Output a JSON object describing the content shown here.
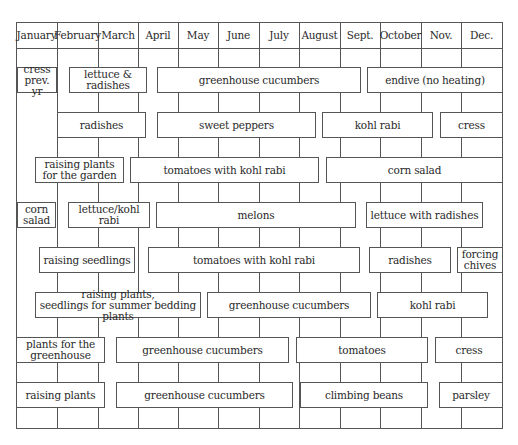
{
  "chart_data": {
    "type": "table",
    "months": [
      "January",
      "February",
      "March",
      "April",
      "May",
      "June",
      "July",
      "August",
      "Sept.",
      "October",
      "Nov.",
      "Dec."
    ],
    "rows": [
      [
        {
          "label": "cress prev. yr",
          "lines": [
            "cress",
            "prev. yr"
          ],
          "start": "January",
          "end": "January"
        },
        {
          "label": "lettuce & radishes",
          "start": "February",
          "end": "March"
        },
        {
          "label": "greenhouse cucumbers",
          "start": "April",
          "end": "August"
        },
        {
          "label": "endive (no heating)",
          "start": "Sept.",
          "end": "Dec."
        }
      ],
      [
        {
          "label": "radishes",
          "start": "February",
          "end": "March"
        },
        {
          "label": "sweet peppers",
          "start": "April",
          "end": "July"
        },
        {
          "label": "kohl rabi",
          "start": "August",
          "end": "October"
        },
        {
          "label": "cress",
          "start": "Nov.",
          "end": "Dec."
        }
      ],
      [
        {
          "label": "raising plants for the garden",
          "lines": [
            "raising plants",
            "for the garden"
          ],
          "start": "January",
          "end": "March"
        },
        {
          "label": "tomatoes with kohl rabi",
          "start": "March",
          "end": "July"
        },
        {
          "label": "corn salad",
          "start": "August",
          "end": "Dec."
        }
      ],
      [
        {
          "label": "corn salad",
          "lines": [
            "corn",
            "salad"
          ],
          "start": "January",
          "end": "January"
        },
        {
          "label": "lettuce/kohl rabi",
          "start": "February",
          "end": "March"
        },
        {
          "label": "melons",
          "start": "April",
          "end": "August"
        },
        {
          "label": "lettuce with radishes",
          "start": "Sept.",
          "end": "Nov."
        }
      ],
      [
        {
          "label": "raising seedlings",
          "start": "January",
          "end": "March"
        },
        {
          "label": "tomatoes with kohl rabi",
          "start": "April",
          "end": "August"
        },
        {
          "label": "radishes",
          "start": "Sept.",
          "end": "Nov."
        },
        {
          "label": "forcing chives",
          "lines": [
            "forcing",
            "chives"
          ],
          "start": "Dec.",
          "end": "Dec."
        }
      ],
      [
        {
          "label": "raising plants, seedlings for summer bedding plants",
          "lines": [
            "raising plants,",
            "seedlings for summer bedding plants"
          ],
          "start": "January",
          "end": "May"
        },
        {
          "label": "greenhouse cucumbers",
          "start": "May",
          "end": "Sept."
        },
        {
          "label": "kohl rabi",
          "start": "Sept.",
          "end": "Nov."
        }
      ],
      [
        {
          "label": "plants for the greenhouse",
          "lines": [
            "plants for the",
            "greenhouse"
          ],
          "start": "January",
          "end": "February"
        },
        {
          "label": "greenhouse cucumbers",
          "start": "March",
          "end": "July"
        },
        {
          "label": "tomatoes",
          "start": "July",
          "end": "October"
        },
        {
          "label": "cress",
          "start": "Nov.",
          "end": "Dec."
        }
      ],
      [
        {
          "label": "raising plants",
          "start": "January",
          "end": "February"
        },
        {
          "label": "greenhouse cucumbers",
          "start": "March",
          "end": "July"
        },
        {
          "label": "climbing beans",
          "start": "July",
          "end": "October"
        },
        {
          "label": "parsley",
          "start": "Nov.",
          "end": "Dec."
        }
      ]
    ]
  },
  "header": {
    "months": [
      "January",
      "February",
      "March",
      "April",
      "May",
      "June",
      "July",
      "August",
      "Sept.",
      "October",
      "Nov.",
      "Dec."
    ]
  },
  "bars": [
    {
      "lines": [
        "cress",
        "prev. yr"
      ],
      "x1": 17,
      "x2": 56,
      "row": 0
    },
    {
      "lines": [
        "lettuce & radishes"
      ],
      "x1": 69,
      "x2": 146,
      "row": 0
    },
    {
      "lines": [
        "greenhouse cucumbers"
      ],
      "x1": 157,
      "x2": 360,
      "row": 0
    },
    {
      "lines": [
        "endive (no heating)"
      ],
      "x1": 367,
      "x2": 502,
      "row": 0
    },
    {
      "lines": [
        "radishes"
      ],
      "x1": 57,
      "x2": 145,
      "row": 1
    },
    {
      "lines": [
        "sweet peppers"
      ],
      "x1": 157,
      "x2": 315,
      "row": 1
    },
    {
      "lines": [
        "kohl rabi"
      ],
      "x1": 322,
      "x2": 432,
      "row": 1
    },
    {
      "lines": [
        "cress"
      ],
      "x1": 440,
      "x2": 502,
      "row": 1
    },
    {
      "lines": [
        "raising plants",
        "for the garden"
      ],
      "x1": 35,
      "x2": 123,
      "row": 2
    },
    {
      "lines": [
        "tomatoes with kohl rabi"
      ],
      "x1": 130,
      "x2": 318,
      "row": 2
    },
    {
      "lines": [
        "corn salad"
      ],
      "x1": 326,
      "x2": 502,
      "row": 2
    },
    {
      "lines": [
        "corn",
        "salad"
      ],
      "x1": 17,
      "x2": 55,
      "row": 3
    },
    {
      "lines": [
        "lettuce/kohl rabi"
      ],
      "x1": 68,
      "x2": 149,
      "row": 3
    },
    {
      "lines": [
        "melons"
      ],
      "x1": 156,
      "x2": 355,
      "row": 3
    },
    {
      "lines": [
        "lettuce with radishes"
      ],
      "x1": 366,
      "x2": 482,
      "row": 3
    },
    {
      "lines": [
        "raising seedlings"
      ],
      "x1": 39,
      "x2": 134,
      "row": 4
    },
    {
      "lines": [
        "tomatoes with kohl rabi"
      ],
      "x1": 148,
      "x2": 359,
      "row": 4
    },
    {
      "lines": [
        "radishes"
      ],
      "x1": 369,
      "x2": 450,
      "row": 4
    },
    {
      "lines": [
        "forcing",
        "chives"
      ],
      "x1": 457,
      "x2": 502,
      "row": 4
    },
    {
      "lines": [
        "raising plants,",
        "seedlings for summer bedding plants"
      ],
      "x1": 35,
      "x2": 200,
      "row": 5
    },
    {
      "lines": [
        "greenhouse cucumbers"
      ],
      "x1": 207,
      "x2": 370,
      "row": 5
    },
    {
      "lines": [
        "kohl rabi"
      ],
      "x1": 377,
      "x2": 487,
      "row": 5
    },
    {
      "lines": [
        "plants for the",
        "greenhouse"
      ],
      "x1": 16,
      "x2": 104,
      "row": 6
    },
    {
      "lines": [
        "greenhouse cucumbers"
      ],
      "x1": 116,
      "x2": 288,
      "row": 6
    },
    {
      "lines": [
        "tomatoes"
      ],
      "x1": 296,
      "x2": 427,
      "row": 6
    },
    {
      "lines": [
        "cress"
      ],
      "x1": 435,
      "x2": 502,
      "row": 6
    },
    {
      "lines": [
        "raising plants"
      ],
      "x1": 16,
      "x2": 104,
      "row": 7
    },
    {
      "lines": [
        "greenhouse cucumbers"
      ],
      "x1": 116,
      "x2": 292,
      "row": 7
    },
    {
      "lines": [
        "climbing beans"
      ],
      "x1": 300,
      "x2": 427,
      "row": 7
    },
    {
      "lines": [
        "parsley"
      ],
      "x1": 439,
      "x2": 502,
      "row": 7
    }
  ]
}
